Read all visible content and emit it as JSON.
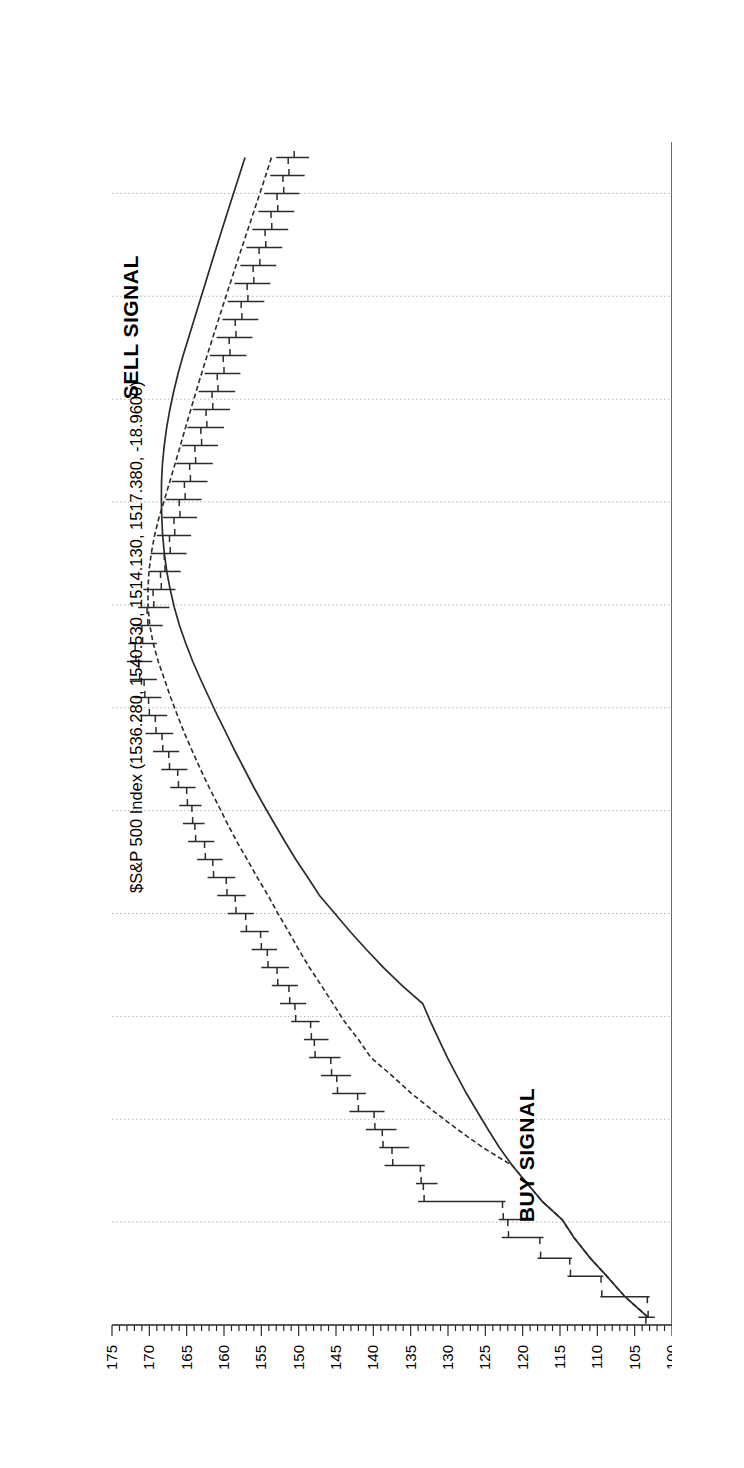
{
  "chart_data": {
    "type": "bar",
    "subtype": "ohlc-bar-chart-rotated",
    "title": "$S&P 500 Index (1536.280, 1540.530, 1514.130, 1517.380, -18.9600)",
    "quote": {
      "open": 1536.28,
      "high": 1540.53,
      "low": 1514.13,
      "close": 1517.38,
      "change": -18.96
    },
    "xlabel": "",
    "ylabel": "",
    "ylim": [
      100,
      175
    ],
    "ytick_step": 5,
    "yminor_step": 1,
    "ytick_labels": [
      "175",
      "170",
      "165",
      "160",
      "155",
      "150",
      "145",
      "140",
      "135",
      "130",
      "125",
      "120",
      "115",
      "110",
      "105",
      "100"
    ],
    "ytick_values": [
      175,
      170,
      165,
      160,
      155,
      150,
      145,
      140,
      135,
      130,
      125,
      120,
      115,
      110,
      105,
      100
    ],
    "grid": true,
    "grid_style": "dotted",
    "legend": "none",
    "orientation": "rotated-90-price-axis-on-top",
    "xtick_labels": [
      "Aug",
      "Sep",
      "Oct",
      "Nov",
      "Dec",
      "1983",
      "Feb",
      "Mar",
      "Apr",
      "May",
      "Jun",
      "Jul",
      "Aug",
      "Sep",
      "Oct",
      "Nov",
      "Dec",
      "1984",
      "Feb",
      "Mar",
      "Apr",
      "May",
      "Jun",
      "J"
    ],
    "annotations": [
      {
        "text": "BUY SIGNAL",
        "near_month": "Oct",
        "near_year": 1982,
        "near_price": 118
      },
      {
        "text": "SELL SIGNAL",
        "near_month": "Mar",
        "near_year": 1984,
        "near_price": 167
      }
    ],
    "overlays": [
      {
        "name": "moving-average-fast",
        "style": "solid"
      },
      {
        "name": "moving-average-slow",
        "style": "dashed"
      }
    ],
    "series": [
      {
        "name": "$S&P 500 Index",
        "field": "ohlc",
        "points": [
          {
            "t": 0.15,
            "o": 103.5,
            "h": 104.5,
            "c": 103.2,
            "l": 102.3
          },
          {
            "t": 0.55,
            "o": 103.3,
            "h": 109.6,
            "c": 109.4,
            "l": 103.0
          },
          {
            "t": 0.95,
            "o": 109.5,
            "h": 114.0,
            "c": 113.6,
            "l": 109.2
          },
          {
            "t": 1.3,
            "o": 113.7,
            "h": 118.0,
            "c": 117.6,
            "l": 113.4
          },
          {
            "t": 1.7,
            "o": 117.7,
            "h": 122.8,
            "c": 121.9,
            "l": 117.2
          },
          {
            "t": 2.05,
            "o": 122.0,
            "h": 123.2,
            "c": 122.6,
            "l": 120.0
          },
          {
            "t": 2.4,
            "o": 122.7,
            "h": 134.0,
            "c": 133.2,
            "l": 122.3
          },
          {
            "t": 2.75,
            "o": 133.3,
            "h": 134.3,
            "c": 133.6,
            "l": 131.4
          },
          {
            "t": 3.1,
            "o": 133.7,
            "h": 138.5,
            "c": 137.4,
            "l": 133.1
          },
          {
            "t": 3.45,
            "o": 137.5,
            "h": 139.2,
            "c": 138.7,
            "l": 135.2
          },
          {
            "t": 3.8,
            "o": 138.8,
            "h": 141.0,
            "c": 139.8,
            "l": 136.9
          },
          {
            "t": 4.15,
            "o": 139.9,
            "h": 143.2,
            "c": 142.0,
            "l": 138.5
          },
          {
            "t": 4.5,
            "o": 142.1,
            "h": 145.5,
            "c": 144.8,
            "l": 141.0
          },
          {
            "t": 4.85,
            "o": 144.9,
            "h": 147.0,
            "c": 145.6,
            "l": 143.0
          },
          {
            "t": 5.2,
            "o": 145.7,
            "h": 148.6,
            "c": 147.8,
            "l": 144.4
          },
          {
            "t": 5.55,
            "o": 147.9,
            "h": 149.3,
            "c": 148.3,
            "l": 146.0
          },
          {
            "t": 5.9,
            "o": 148.4,
            "h": 151.0,
            "c": 150.4,
            "l": 147.2
          },
          {
            "t": 6.25,
            "o": 150.5,
            "h": 152.5,
            "c": 151.2,
            "l": 149.0
          },
          {
            "t": 6.6,
            "o": 151.3,
            "h": 153.6,
            "c": 152.8,
            "l": 150.1
          },
          {
            "t": 6.95,
            "o": 152.9,
            "h": 155.0,
            "c": 154.1,
            "l": 151.3
          },
          {
            "t": 7.3,
            "o": 154.2,
            "h": 156.3,
            "c": 155.0,
            "l": 152.9
          },
          {
            "t": 7.65,
            "o": 155.1,
            "h": 157.8,
            "c": 157.0,
            "l": 154.0
          },
          {
            "t": 8.0,
            "o": 157.1,
            "h": 159.5,
            "c": 158.4,
            "l": 156.0
          },
          {
            "t": 8.35,
            "o": 158.5,
            "h": 160.9,
            "c": 159.6,
            "l": 157.1
          },
          {
            "t": 8.7,
            "o": 159.7,
            "h": 162.2,
            "c": 161.4,
            "l": 158.5
          },
          {
            "t": 9.05,
            "o": 161.5,
            "h": 163.6,
            "c": 162.5,
            "l": 160.2
          },
          {
            "t": 9.4,
            "o": 162.6,
            "h": 164.8,
            "c": 163.8,
            "l": 161.3
          },
          {
            "t": 9.75,
            "o": 163.9,
            "h": 165.5,
            "c": 164.2,
            "l": 162.6
          },
          {
            "t": 10.1,
            "o": 164.3,
            "h": 166.0,
            "c": 164.9,
            "l": 163.0
          },
          {
            "t": 10.45,
            "o": 165.0,
            "h": 167.2,
            "c": 166.1,
            "l": 163.8
          },
          {
            "t": 10.8,
            "o": 166.2,
            "h": 168.4,
            "c": 167.3,
            "l": 164.9
          },
          {
            "t": 11.15,
            "o": 167.4,
            "h": 169.5,
            "c": 168.2,
            "l": 166.0
          },
          {
            "t": 11.5,
            "o": 168.3,
            "h": 170.5,
            "c": 169.1,
            "l": 166.8
          },
          {
            "t": 11.85,
            "o": 169.2,
            "h": 171.3,
            "c": 170.0,
            "l": 167.6
          },
          {
            "t": 12.2,
            "o": 170.1,
            "h": 172.0,
            "c": 170.6,
            "l": 168.4
          },
          {
            "t": 12.55,
            "o": 170.7,
            "h": 172.6,
            "c": 171.3,
            "l": 169.0
          },
          {
            "t": 12.9,
            "o": 171.4,
            "h": 173.0,
            "c": 171.8,
            "l": 169.6
          },
          {
            "t": 13.25,
            "o": 171.9,
            "h": 172.8,
            "c": 170.9,
            "l": 169.0
          },
          {
            "t": 13.6,
            "o": 171.0,
            "h": 172.2,
            "c": 170.2,
            "l": 168.2
          },
          {
            "t": 13.95,
            "o": 170.3,
            "h": 171.5,
            "c": 169.4,
            "l": 167.3
          },
          {
            "t": 14.3,
            "o": 169.5,
            "h": 170.8,
            "c": 168.4,
            "l": 166.5
          },
          {
            "t": 14.65,
            "o": 168.5,
            "h": 170.0,
            "c": 167.9,
            "l": 165.8
          },
          {
            "t": 15.0,
            "o": 168.0,
            "h": 169.8,
            "c": 167.2,
            "l": 165.0
          },
          {
            "t": 15.35,
            "o": 167.3,
            "h": 169.0,
            "c": 166.6,
            "l": 164.4
          },
          {
            "t": 15.7,
            "o": 166.7,
            "h": 168.2,
            "c": 165.9,
            "l": 163.6
          },
          {
            "t": 16.05,
            "o": 166.0,
            "h": 167.8,
            "c": 165.2,
            "l": 163.0
          },
          {
            "t": 16.4,
            "o": 165.3,
            "h": 167.0,
            "c": 164.5,
            "l": 162.2
          },
          {
            "t": 16.75,
            "o": 164.6,
            "h": 166.4,
            "c": 163.8,
            "l": 161.5
          },
          {
            "t": 17.1,
            "o": 163.9,
            "h": 165.6,
            "c": 163.0,
            "l": 160.8
          },
          {
            "t": 17.45,
            "o": 163.1,
            "h": 164.9,
            "c": 162.3,
            "l": 160.0
          },
          {
            "t": 17.8,
            "o": 162.4,
            "h": 164.2,
            "c": 161.5,
            "l": 159.2
          },
          {
            "t": 18.15,
            "o": 161.6,
            "h": 163.4,
            "c": 160.8,
            "l": 158.5
          },
          {
            "t": 18.5,
            "o": 160.9,
            "h": 162.6,
            "c": 160.0,
            "l": 157.8
          },
          {
            "t": 18.85,
            "o": 160.1,
            "h": 161.9,
            "c": 159.2,
            "l": 157.0
          },
          {
            "t": 19.2,
            "o": 159.3,
            "h": 161.0,
            "c": 158.4,
            "l": 156.2
          },
          {
            "t": 19.55,
            "o": 158.5,
            "h": 160.2,
            "c": 157.6,
            "l": 155.4
          },
          {
            "t": 19.9,
            "o": 157.7,
            "h": 159.5,
            "c": 156.8,
            "l": 154.6
          },
          {
            "t": 20.25,
            "o": 156.9,
            "h": 158.6,
            "c": 156.0,
            "l": 153.8
          },
          {
            "t": 20.6,
            "o": 156.1,
            "h": 157.8,
            "c": 155.2,
            "l": 153.0
          },
          {
            "t": 20.95,
            "o": 155.3,
            "h": 157.0,
            "c": 154.4,
            "l": 152.2
          },
          {
            "t": 21.3,
            "o": 154.5,
            "h": 156.2,
            "c": 153.6,
            "l": 151.4
          },
          {
            "t": 21.65,
            "o": 153.7,
            "h": 155.4,
            "c": 152.8,
            "l": 150.6
          },
          {
            "t": 22.0,
            "o": 152.9,
            "h": 154.6,
            "c": 152.0,
            "l": 149.9
          },
          {
            "t": 22.35,
            "o": 152.1,
            "h": 153.8,
            "c": 151.3,
            "l": 149.2
          },
          {
            "t": 22.7,
            "o": 151.4,
            "h": 153.0,
            "c": 150.6,
            "l": 148.6
          }
        ]
      }
    ]
  },
  "axis": {
    "price_labels": [
      "175",
      "170",
      "165",
      "160",
      "155",
      "150",
      "145",
      "140",
      "135",
      "130",
      "125",
      "120",
      "115",
      "110",
      "105",
      "100"
    ],
    "month_labels": [
      "Aug",
      "Sep",
      "Oct",
      "Nov",
      "Dec",
      "1983",
      "Feb",
      "Mar",
      "Apr",
      "May",
      "Jun",
      "Jul",
      "Aug",
      "Sep",
      "Oct",
      "Nov",
      "Dec",
      "1984",
      "Feb",
      "Mar",
      "Apr",
      "May",
      "Jun",
      "J"
    ]
  },
  "title": {
    "text": "$S&P 500 Index (1536.280, 1540.530, 1514.130, 1517.380, -18.9600)"
  },
  "annotations": {
    "buy": "BUY SIGNAL",
    "sell": "SELL SIGNAL"
  },
  "colors": {
    "ink": "#2b2b2b",
    "grid": "#b4b4b4",
    "background": "#ffffff"
  }
}
